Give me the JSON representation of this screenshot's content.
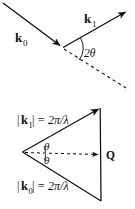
{
  "figure": {
    "title_present": false,
    "background_color": "#ffffff",
    "stroke_color": "#111111",
    "panels": [
      {
        "id": "scattering-geometry",
        "description": "Incident and scattered wavevector arrows meeting at a scattering point with the scattering angle marked",
        "labels": {
          "incident_vector": "k",
          "incident_subscript": "0",
          "scattered_vector": "k",
          "scattered_subscript": "1",
          "angle": "2θ"
        }
      },
      {
        "id": "ewald-triangle",
        "description": "Vector triangle showing k0 and k1 of equal magnitude closing on the scattering vector Q",
        "labels": {
          "k1_magnitude": "|k₁| = 2π/λ",
          "k1_bar_left": "|",
          "k1_k": "k",
          "k1_sub": "1",
          "k1_bar_right": "|",
          "k1_rhs": "= 2π/λ",
          "k0_magnitude": "|k₀| = 2π/λ",
          "k0_bar_left": "|",
          "k0_k": "k",
          "k0_sub": "0",
          "k0_bar_right": "|",
          "k0_rhs": "= 2π/λ",
          "angle_upper": "θ",
          "angle_lower": "θ",
          "scattering_vector": "Q"
        }
      }
    ],
    "symbols": {
      "pi": "π",
      "lambda": "λ",
      "theta": "θ",
      "two_theta": "2θ"
    }
  }
}
